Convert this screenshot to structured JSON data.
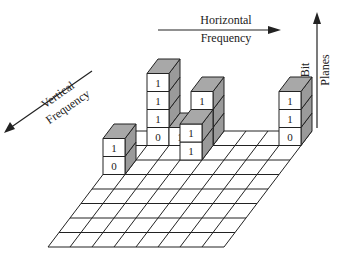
{
  "diagram": {
    "type": "bit-plane decomposition of DCT coefficients (3D block grid)",
    "axes": {
      "horizontal": {
        "line1": "Horizontal",
        "line2": "Frequency"
      },
      "vertical": {
        "line1": "Vertical",
        "line2": "Frequency"
      },
      "bitplanes": {
        "line1": "Bit",
        "line2": "Planes"
      }
    },
    "grid": {
      "rows": 8,
      "cols": 8
    },
    "stacks": [
      {
        "id": "stack-a",
        "row": 0,
        "col": 1,
        "bits_bottom_to_top": [
          "0",
          "1",
          "1",
          "1"
        ]
      },
      {
        "id": "stack-b",
        "row": 0,
        "col": 2,
        "bits_bottom_to_top": [
          "1"
        ]
      },
      {
        "id": "stack-c",
        "row": 0,
        "col": 3,
        "bits_bottom_to_top": [
          "1",
          "0",
          "1"
        ]
      },
      {
        "id": "stack-d",
        "row": 1,
        "col": 3,
        "bits_bottom_to_top": [
          "1",
          "1"
        ]
      },
      {
        "id": "stack-e",
        "row": 0,
        "col": 7,
        "bits_bottom_to_top": [
          "0",
          "1",
          "1"
        ]
      },
      {
        "id": "stack-f",
        "row": 2,
        "col": 0,
        "bits_bottom_to_top": [
          "0",
          "1"
        ]
      }
    ],
    "colors": {
      "line": "#222222",
      "block_top": "#a8a8a8",
      "block_side": "#9a9a9a",
      "block_front": "#ffffff"
    }
  }
}
